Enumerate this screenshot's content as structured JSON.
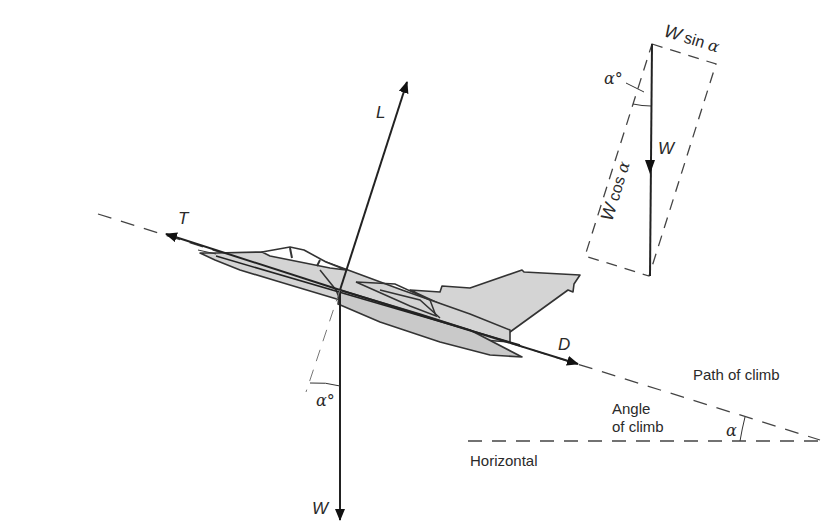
{
  "diagram": {
    "forces": {
      "lift": "L",
      "thrust": "T",
      "drag": "D",
      "weight": "W"
    },
    "resolution_inset": {
      "weight": "W",
      "w_sin": "W sin α",
      "w_cos": "W cos α",
      "angle": "α°"
    },
    "angle_labels": {
      "fuselage_angle": "α°",
      "climb_angle": "α"
    },
    "text_labels": {
      "path_of_climb": "Path of climb",
      "angle_of_climb_line1": "Angle",
      "angle_of_climb_line2": "of climb",
      "horizontal": "Horizontal"
    },
    "colors": {
      "line": "#222222",
      "aircraft_fill": "#d4d4d4",
      "text": "#2a2a2a"
    }
  }
}
